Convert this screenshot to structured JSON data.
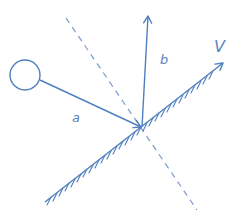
{
  "diagram": {
    "title": "",
    "stroke_color": "#4f7fbf",
    "labels": {
      "incoming": "a",
      "normal_out": "b",
      "surface_direction": "V"
    },
    "elements": {
      "ball": {
        "cx": 25,
        "cy": 75,
        "r": 15
      },
      "incoming_vector": {
        "x1": 40,
        "y1": 80,
        "x2": 141,
        "y2": 127,
        "label": "a"
      },
      "outgoing_vector": {
        "x1": 142,
        "y1": 127,
        "x2": 148,
        "y2": 16,
        "label": "b"
      },
      "dashed_normal": {
        "x1": 66,
        "y1": 18,
        "x2": 197,
        "y2": 210
      },
      "surface": {
        "x1": 45,
        "y1": 202,
        "x2": 223,
        "y2": 63,
        "label": "V",
        "hatched_side": "below"
      }
    }
  }
}
